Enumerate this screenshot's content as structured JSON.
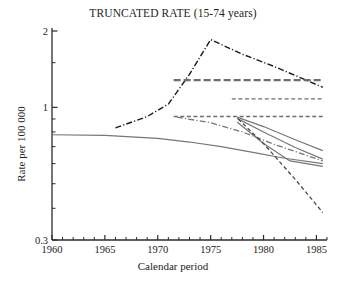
{
  "chart_data": {
    "type": "line",
    "title": "TRUNCATED RATE (15-74 years)",
    "xlabel": "Calendar period",
    "ylabel": "Rate per 100 000",
    "xlim": [
      1960,
      1986
    ],
    "ylim": [
      0.3,
      2
    ],
    "yscale": "log",
    "grid": false,
    "legend": "none",
    "xticks": [
      1960,
      1965,
      1970,
      1975,
      1980,
      1985
    ],
    "xtick_labels": [
      "1960",
      "1965",
      "1970",
      "1975",
      "1980",
      "1985"
    ],
    "xminor_ticks_step": 1,
    "yticks": [
      0.3,
      1,
      2
    ],
    "ytick_labels": [
      "0.3",
      "1",
      "2"
    ],
    "yminor_ticks": [
      0.4,
      0.5,
      0.6,
      0.7,
      0.8,
      0.9,
      1.5
    ],
    "series": [
      {
        "name": "observed-rate",
        "style": "dash-dot",
        "color": "#1a1a1a",
        "width": 1.4,
        "x": [
          1966,
          1969,
          1971,
          1973,
          1975,
          1978,
          1981,
          1985.6
        ],
        "y": [
          0.83,
          0.92,
          1.03,
          1.35,
          1.85,
          1.62,
          1.45,
          1.2
        ]
      },
      {
        "name": "fitted-flat-upper",
        "style": "dashed",
        "color": "#6e6e6e",
        "width": 2.4,
        "x": [
          1971.5,
          1985.6
        ],
        "y": [
          1.28,
          1.28
        ]
      },
      {
        "name": "fitted-flat-middle",
        "style": "dashed",
        "color": "#6e6e6e",
        "width": 1.4,
        "x": [
          1977.0,
          1985.6
        ],
        "y": [
          1.08,
          1.08
        ]
      },
      {
        "name": "fitted-flat-lower",
        "style": "dashed",
        "color": "#6e6e6e",
        "width": 1.6,
        "x": [
          1971.5,
          1985.6
        ],
        "y": [
          0.92,
          0.92
        ]
      },
      {
        "name": "baseline-cohort-curve",
        "style": "solid",
        "color": "#767676",
        "width": 1.2,
        "x": [
          1960,
          1965,
          1970,
          1973,
          1976,
          1979,
          1982,
          1985.6
        ],
        "y": [
          0.78,
          0.775,
          0.755,
          0.73,
          0.7,
          0.665,
          0.63,
          0.6
        ]
      },
      {
        "name": "projection-upper-solid",
        "style": "solid",
        "color": "#767676",
        "width": 1.2,
        "x": [
          1977.5,
          1980,
          1983,
          1985.6
        ],
        "y": [
          0.915,
          0.84,
          0.745,
          0.675
        ]
      },
      {
        "name": "projection-lower-solid",
        "style": "solid",
        "color": "#767676",
        "width": 1.2,
        "x": [
          1977.5,
          1980,
          1983,
          1985.6
        ],
        "y": [
          0.905,
          0.8,
          0.695,
          0.625
        ]
      },
      {
        "name": "projection-flattening-solid",
        "style": "solid",
        "color": "#767676",
        "width": 1.2,
        "x": [
          1977.5,
          1980,
          1982.5,
          1985.6
        ],
        "y": [
          0.875,
          0.72,
          0.615,
          0.585
        ]
      },
      {
        "name": "projection-dash-dot-gray",
        "style": "dash-dot",
        "color": "#767676",
        "width": 1.3,
        "x": [
          1971.8,
          1975,
          1978,
          1981,
          1985.6
        ],
        "y": [
          0.915,
          0.87,
          0.8,
          0.715,
          0.615
        ]
      },
      {
        "name": "projection-steep-dashed",
        "style": "dashed",
        "color": "#4a4a4a",
        "width": 1.3,
        "x": [
          1977.6,
          1980,
          1983,
          1985.6
        ],
        "y": [
          0.9,
          0.72,
          0.52,
          0.385
        ]
      }
    ]
  }
}
